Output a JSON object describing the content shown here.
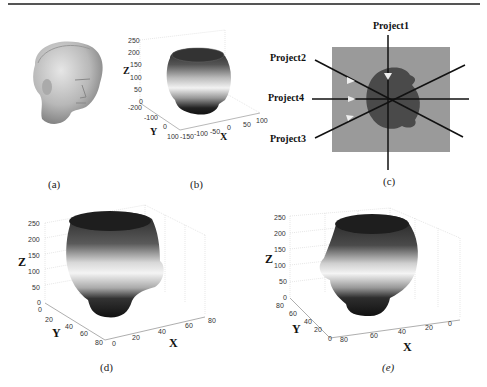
{
  "figure": {
    "panels": [
      {
        "id": "a",
        "caption": "(a)",
        "content": "3D rendered head statue (sculpture bust)"
      },
      {
        "id": "b",
        "caption": "(b)",
        "axes": {
          "z_label": "Z",
          "y_label": "Y",
          "x_label": "X",
          "z_ticks": [
            "250",
            "200",
            "150",
            "100",
            "50",
            "0"
          ],
          "y_ticks": [
            "-200",
            "-100",
            "0",
            "100"
          ],
          "x_ticks": [
            "-150",
            "-100",
            "-50",
            "0",
            "50",
            "100"
          ]
        }
      },
      {
        "id": "c",
        "caption": "(c)",
        "projections": [
          "Project1",
          "Project2",
          "Project4",
          "Project3"
        ]
      },
      {
        "id": "d",
        "caption": "(d)",
        "axes": {
          "z_label": "Z",
          "y_label": "Y",
          "x_label": "X",
          "z_ticks": [
            "250",
            "200",
            "150",
            "100",
            "50",
            "0"
          ],
          "y_ticks": [
            "0",
            "20",
            "40",
            "60",
            "80"
          ],
          "x_ticks": [
            "0",
            "20",
            "40",
            "60",
            "80"
          ]
        }
      },
      {
        "id": "e",
        "caption": "(e)",
        "axes": {
          "z_label": "Z",
          "y_label": "Y",
          "x_label": "X",
          "z_ticks": [
            "250",
            "200",
            "150",
            "100",
            "50",
            "0"
          ],
          "y_ticks": [
            "80",
            "60",
            "40",
            "20",
            "0"
          ],
          "x_ticks": [
            "80",
            "60",
            "40",
            "20",
            "0"
          ]
        }
      }
    ]
  }
}
